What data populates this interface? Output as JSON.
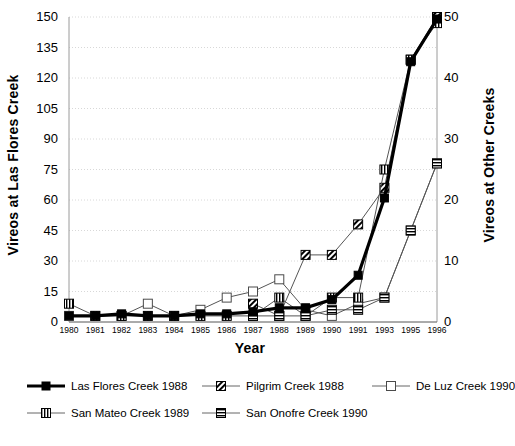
{
  "chart_data": {
    "type": "line",
    "title": "",
    "xlabel": "Year",
    "ylabel": "Vireos at Las Flores Creek",
    "ylabel_right": "Vireos at Other Creeks",
    "grid": true,
    "legend_position": "bottom",
    "categories": [
      "1980",
      "1981",
      "1982",
      "1983",
      "1984",
      "1985",
      "1986",
      "1987",
      "1988",
      "1989",
      "1990",
      "1991",
      "1993",
      "1995",
      "1996"
    ],
    "ylim": [
      0,
      150
    ],
    "yticks": [
      0,
      15,
      30,
      45,
      60,
      75,
      90,
      105,
      120,
      135,
      150
    ],
    "ylim_right": [
      0,
      50
    ],
    "yticks_right": [
      0,
      10,
      20,
      30,
      40,
      50
    ],
    "series": [
      {
        "name": "Las Flores Creek 1988",
        "axis": "left",
        "marker": "filled-square",
        "line": "thick-black",
        "values": [
          3,
          3,
          4,
          3,
          3,
          4,
          4,
          5,
          7,
          7,
          11,
          23,
          61,
          128,
          149
        ]
      },
      {
        "name": "Pilgrim Creek 1988",
        "axis": "right",
        "marker": "hatched-square",
        "line": "thin-gray",
        "values": [
          null,
          null,
          null,
          null,
          null,
          null,
          null,
          3,
          1,
          11,
          11,
          16,
          22,
          43,
          50
        ]
      },
      {
        "name": "De Luz Creek 1990",
        "axis": "right",
        "marker": "open-square",
        "line": "thin-gray",
        "values": [
          1,
          1,
          1,
          3,
          1,
          2,
          4,
          5,
          7,
          2,
          1,
          3,
          4,
          15,
          26
        ]
      },
      {
        "name": "San Mateo Creek 1989",
        "axis": "right",
        "marker": "vbar-square",
        "line": "thin-gray",
        "values": [
          3,
          1,
          1,
          1,
          1,
          1,
          1,
          1,
          4,
          1,
          4,
          4,
          25,
          43,
          49
        ]
      },
      {
        "name": "San Onofre Creek 1990",
        "axis": "right",
        "marker": "hbar-square",
        "line": "thin-gray",
        "values": [
          null,
          null,
          null,
          null,
          null,
          null,
          null,
          1,
          1,
          1,
          2,
          2,
          4,
          15,
          26
        ]
      }
    ],
    "legend_entries": [
      "Las Flores Creek 1988",
      "Pilgrim Creek 1988",
      "De Luz Creek 1990",
      "San Mateo Creek 1989",
      "San Onofre Creek 1990"
    ],
    "colors": {
      "primary_line": "#000000",
      "secondary_line": "#555555",
      "grid": "#d8d8d8",
      "background": "#ffffff"
    }
  }
}
